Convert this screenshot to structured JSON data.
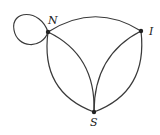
{
  "diagram": {
    "type": "multigraph",
    "nodes": [
      {
        "id": "N",
        "label": "N",
        "x": 48,
        "y": 32
      },
      {
        "id": "I",
        "label": "I",
        "x": 141,
        "y": 31
      },
      {
        "id": "S",
        "label": "S",
        "x": 94,
        "y": 112
      }
    ],
    "edges": [
      {
        "from": "N",
        "to": "N",
        "kind": "loop"
      },
      {
        "from": "N",
        "to": "I",
        "kind": "arc"
      },
      {
        "from": "N",
        "to": "S",
        "kind": "outer-arc"
      },
      {
        "from": "N",
        "to": "S",
        "kind": "inner-arc"
      },
      {
        "from": "I",
        "to": "S",
        "kind": "inner-arc"
      },
      {
        "from": "I",
        "to": "S",
        "kind": "outer-arc"
      }
    ],
    "colors": {
      "stroke": "#3a3a3a",
      "node": "#222222",
      "background": "#ffffff"
    }
  }
}
